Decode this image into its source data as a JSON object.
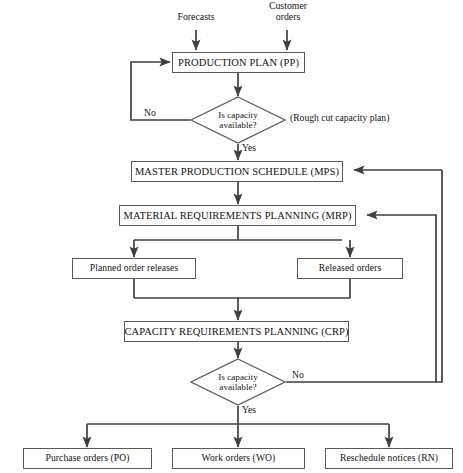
{
  "diagram": {
    "line_color": "#3f3f3f",
    "box_border_color": "#595959",
    "text_color": "#121212",
    "background": "#ffffff"
  },
  "inputs": [
    {
      "id": "forecasts",
      "label": "Forecasts"
    },
    {
      "id": "customer-orders",
      "label": "Customer\norders",
      "line1": "Customer",
      "line2": "orders"
    }
  ],
  "nodes": [
    {
      "id": "production-plan",
      "label": "PRODUCTION PLAN (PP)",
      "type": "process"
    },
    {
      "id": "capacity-check-1",
      "label": "Is capacity available?",
      "line1": "Is capacity",
      "line2": "available?",
      "type": "decision"
    },
    {
      "id": "master-production-schedule",
      "label": "MASTER PRODUCTION SCHEDULE (MPS)",
      "type": "process"
    },
    {
      "id": "material-requirements-planning",
      "label": "MATERIAL REQUIREMENTS PLANNING (MRP)",
      "type": "process"
    },
    {
      "id": "planned-order-releases",
      "label": "Planned order releases",
      "type": "process"
    },
    {
      "id": "released-orders",
      "label": "Released orders",
      "type": "process"
    },
    {
      "id": "capacity-requirements-planning",
      "label": "CAPACITY REQUIREMENTS PLANNING (CRP)",
      "type": "process"
    },
    {
      "id": "capacity-check-2",
      "label": "Is capacity available?",
      "line1": "Is capacity",
      "line2": "available?",
      "type": "decision"
    },
    {
      "id": "purchase-orders",
      "label": "Purchase orders (PO)",
      "type": "process"
    },
    {
      "id": "work-orders",
      "label": "Work orders (WO)",
      "type": "process"
    },
    {
      "id": "reschedule-notices",
      "label": "Reschedule notices (RN)",
      "type": "process"
    }
  ],
  "edge_labels": {
    "no_top": "No",
    "yes_top": "Yes",
    "no_bottom": "No",
    "yes_bottom": "Yes"
  },
  "annotations": [
    {
      "id": "rough-cut-capacity-plan",
      "label": "(Rough cut capacity plan)"
    }
  ]
}
